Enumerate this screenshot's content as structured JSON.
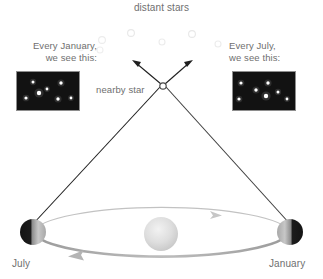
{
  "diagram": {
    "title": "distant stars",
    "nearby_star_label": "nearby star",
    "left_panel": {
      "caption_line1": "Every January,",
      "caption_line2": "we see this:",
      "stars": [
        {
          "x": 16,
          "y": 10,
          "r": 1.5
        },
        {
          "x": 30,
          "y": 17,
          "r": 1.4
        },
        {
          "x": 22,
          "y": 21,
          "r": 2.2
        },
        {
          "x": 9,
          "y": 26,
          "r": 1.6
        },
        {
          "x": 44,
          "y": 11,
          "r": 1.7
        },
        {
          "x": 41,
          "y": 27,
          "r": 1.7
        },
        {
          "x": 54,
          "y": 26,
          "r": 1.4
        }
      ]
    },
    "right_panel": {
      "caption_line1": "Every July,",
      "caption_line2": "we see this:",
      "stars": [
        {
          "x": 8,
          "y": 11,
          "r": 1.6
        },
        {
          "x": 23,
          "y": 18,
          "r": 1.7
        },
        {
          "x": 6,
          "y": 27,
          "r": 1.6
        },
        {
          "x": 35,
          "y": 11,
          "r": 1.7
        },
        {
          "x": 33,
          "y": 24,
          "r": 2.2
        },
        {
          "x": 45,
          "y": 20,
          "r": 1.5
        },
        {
          "x": 54,
          "y": 27,
          "r": 1.4
        }
      ]
    },
    "earth_july": {
      "label": "July",
      "cx": 33,
      "cy": 232,
      "r": 13
    },
    "earth_january": {
      "label": "January",
      "cx": 290,
      "cy": 232,
      "r": 13
    },
    "sun": {
      "cx": 161,
      "cy": 234,
      "r": 17
    },
    "nearby_star_point": {
      "cx": 163,
      "cy": 86,
      "r": 3.2
    },
    "distant_stars": [
      {
        "x": 102,
        "y": 40,
        "r": 3.4
      },
      {
        "x": 131,
        "y": 33,
        "r": 3.4
      },
      {
        "x": 192,
        "y": 34,
        "r": 3.4
      },
      {
        "x": 162,
        "y": 42,
        "r": 3.0
      },
      {
        "x": 218,
        "y": 44,
        "r": 3.0
      },
      {
        "x": 100,
        "y": 50,
        "r": 3.0
      },
      {
        "x": 81,
        "y": 48,
        "r": 2.6
      }
    ],
    "sight_line_left": {
      "x1": 33,
      "y1": 224,
      "x2": 146,
      "y2": 66
    },
    "sight_line_right": {
      "x1": 290,
      "y1": 224,
      "x2": 181,
      "y2": 66
    },
    "colors": {
      "text": "#6f6f6f",
      "starbox_background": "#121212",
      "starbox_border": "#8e8e8e",
      "star_dot": "#ffffff",
      "sight_line": "#1a1a1a",
      "orbit": "#b8b8b8",
      "sun": "#d8d8d8",
      "earth_dark": "#1e1e1e",
      "earth_light": "#c9c9c9",
      "distant_star": "#ededed"
    }
  }
}
